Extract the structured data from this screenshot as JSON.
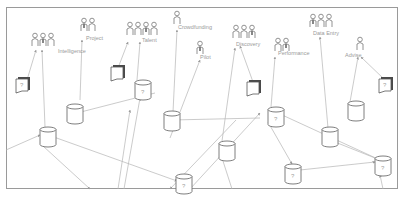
{
  "diagram": {
    "frame": {
      "x": 6,
      "y": 7,
      "w": 392,
      "h": 182
    },
    "actor_groups": [
      {
        "id": "g1",
        "label": "Intelligence",
        "x": 32,
        "y": 33,
        "count": 3,
        "label_x": 58,
        "label_y": 53
      },
      {
        "id": "g2",
        "label": "Project",
        "x": 81,
        "y": 18,
        "count": 2,
        "label_x": 86,
        "label_y": 40
      },
      {
        "id": "g3",
        "label": "Talent",
        "x": 127,
        "y": 22,
        "count": 4,
        "label_x": 142,
        "label_y": 42
      },
      {
        "id": "g4",
        "label": "Crowdfunding",
        "x": 174,
        "y": 11,
        "count": 1,
        "label_x": 178,
        "label_y": 29
      },
      {
        "id": "g5",
        "label": "Pilot",
        "x": 197,
        "y": 41,
        "count": 1,
        "label_x": 200,
        "label_y": 59
      },
      {
        "id": "g6",
        "label": "Discovery",
        "x": 233,
        "y": 25,
        "count": 3,
        "label_x": 236,
        "label_y": 46
      },
      {
        "id": "g7",
        "label": "Performance",
        "x": 275,
        "y": 38,
        "count": 2,
        "label_x": 278,
        "label_y": 55
      },
      {
        "id": "g8",
        "label": "Data Entry",
        "x": 310,
        "y": 14,
        "count": 3,
        "label_x": 313,
        "label_y": 35
      },
      {
        "id": "g9",
        "label": "Advise",
        "x": 357,
        "y": 37,
        "count": 1,
        "label_x": 345,
        "label_y": 57
      }
    ],
    "documents": [
      {
        "id": "d1",
        "x": 16,
        "y": 79,
        "mark": "?"
      },
      {
        "id": "d2",
        "x": 111,
        "y": 67,
        "mark": ""
      },
      {
        "id": "d3",
        "x": 247,
        "y": 82,
        "mark": ""
      },
      {
        "id": "d4",
        "x": 379,
        "y": 79,
        "mark": "?"
      }
    ],
    "cylinders": [
      {
        "id": "c1",
        "x": 67,
        "y": 104,
        "mark": ""
      },
      {
        "id": "c2",
        "x": 135,
        "y": 80,
        "mark": "?"
      },
      {
        "id": "c3",
        "x": 40,
        "y": 127,
        "mark": ""
      },
      {
        "id": "c4",
        "x": 164,
        "y": 111,
        "mark": ""
      },
      {
        "id": "c5",
        "x": 268,
        "y": 107,
        "mark": "?"
      },
      {
        "id": "c6",
        "x": 348,
        "y": 101,
        "mark": ""
      },
      {
        "id": "c7",
        "x": 219,
        "y": 141,
        "mark": ""
      },
      {
        "id": "c8",
        "x": 322,
        "y": 127,
        "mark": ""
      },
      {
        "id": "c9",
        "x": 285,
        "y": 164,
        "mark": "?"
      },
      {
        "id": "c10",
        "x": 375,
        "y": 156,
        "mark": "?"
      },
      {
        "id": "c11",
        "x": 176,
        "y": 174,
        "mark": "?"
      }
    ],
    "edges": [
      [
        27,
        80,
        36,
        50
      ],
      [
        45,
        127,
        42,
        50
      ],
      [
        80,
        100,
        82,
        40
      ],
      [
        118,
        68,
        128,
        42
      ],
      [
        137,
        80,
        140,
        42
      ],
      [
        173,
        112,
        177,
        30
      ],
      [
        170,
        138,
        200,
        60
      ],
      [
        253,
        82,
        240,
        46
      ],
      [
        271,
        107,
        275,
        57
      ],
      [
        222,
        141,
        235,
        48
      ],
      [
        328,
        128,
        320,
        37
      ],
      [
        350,
        102,
        358,
        57
      ],
      [
        385,
        80,
        361,
        57
      ],
      [
        6,
        150,
        40,
        135
      ],
      [
        43,
        146,
        90,
        189
      ],
      [
        51,
        136,
        177,
        181
      ],
      [
        155,
        93,
        73,
        114
      ],
      [
        260,
        118,
        172,
        120
      ],
      [
        280,
        114,
        380,
        160
      ],
      [
        268,
        122,
        292,
        164
      ],
      [
        300,
        170,
        375,
        162
      ],
      [
        335,
        142,
        380,
        160
      ],
      [
        124,
        189,
        140,
        98
      ],
      [
        118,
        189,
        130,
        110
      ],
      [
        232,
        189,
        222,
        158
      ],
      [
        186,
        189,
        181,
        193
      ],
      [
        383,
        189,
        380,
        175
      ],
      [
        236,
        120,
        170,
        189
      ],
      [
        190,
        189,
        260,
        113
      ]
    ]
  }
}
